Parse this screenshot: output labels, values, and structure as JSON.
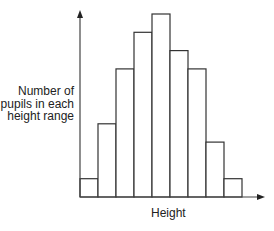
{
  "chart_data": {
    "type": "bar",
    "subtype": "histogram",
    "title": "",
    "xlabel": "Height",
    "ylabel": "Number of pupils in each height range",
    "ylabel_lines": [
      "Number of",
      "pupils in each",
      "height range"
    ],
    "categories": [
      "1",
      "2",
      "3",
      "4",
      "5",
      "6",
      "7",
      "8",
      "9"
    ],
    "values": [
      1,
      4,
      7,
      9,
      10,
      8,
      7,
      3,
      1
    ],
    "ylim": [
      0,
      10.5
    ],
    "grid": false,
    "legend": null,
    "tick_labels": false,
    "bar_fill": "#ffffff",
    "bar_stroke": "#333333",
    "axis_color": "#444444"
  }
}
